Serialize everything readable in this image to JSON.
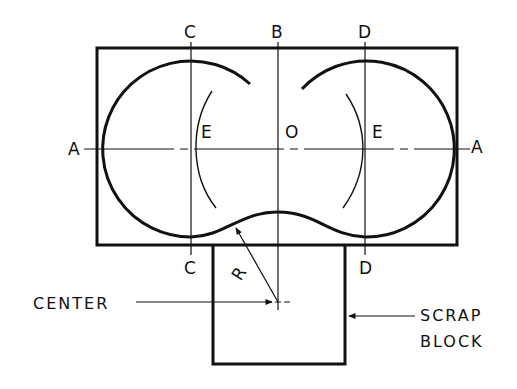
{
  "diagram": {
    "labels": {
      "top_left_axis": "C",
      "top_center_axis": "B",
      "top_right_axis": "D",
      "bottom_left_axis": "C",
      "bottom_right_axis": "D",
      "left_axis": "A",
      "right_axis": "A",
      "left_point": "E",
      "center_point": "O",
      "right_point": "E",
      "radius": "R"
    },
    "callouts": {
      "center": "CENTER",
      "scrap_line1": "SCRAP",
      "scrap_line2": "BLOCK"
    },
    "colors": {
      "ink": "#111111",
      "background": "#ffffff"
    }
  }
}
